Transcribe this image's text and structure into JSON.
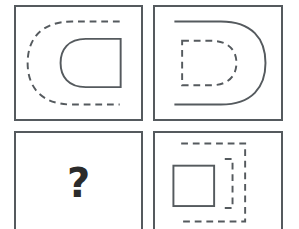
{
  "puzzle": {
    "type": "visual-analogy-matrix",
    "rows": 2,
    "columns": 2,
    "background_color": "#ffffff",
    "stroke_color": "#555a5e",
    "question_color": "#2b2b2b",
    "panels": [
      {
        "id": "A",
        "position": "top-left",
        "description": "large dashed D-shape opening to the right containing a small solid D-shape opening to the left",
        "outer_shape": {
          "name": "d-shape-rounded-left",
          "style": "dashed",
          "size": "large",
          "orientation": "rounded-left-flat-right"
        },
        "inner_shape": {
          "name": "d-shape-rounded-left",
          "style": "solid",
          "size": "small",
          "orientation": "rounded-left-flat-right"
        }
      },
      {
        "id": "B",
        "position": "top-right",
        "description": "large solid D-shape rounded on the right containing a small dashed D-shape rounded on the right",
        "outer_shape": {
          "name": "d-shape-rounded-right",
          "style": "solid",
          "size": "large",
          "orientation": "flat-left-rounded-right"
        },
        "inner_shape": {
          "name": "d-shape-rounded-right",
          "style": "dashed",
          "size": "small",
          "orientation": "flat-left-rounded-right"
        }
      },
      {
        "id": "C",
        "position": "bottom-left",
        "description": "unknown answer panel marked with a question mark",
        "question_mark": "?"
      },
      {
        "id": "D",
        "position": "bottom-right",
        "description": "large dashed square bracket shape opening to the left containing a small solid square",
        "outer_shape": {
          "name": "bracket-shape-square",
          "style": "dashed",
          "size": "large",
          "orientation": "open-left"
        },
        "inner_shape": {
          "name": "square",
          "style": "solid",
          "size": "small"
        }
      }
    ]
  }
}
